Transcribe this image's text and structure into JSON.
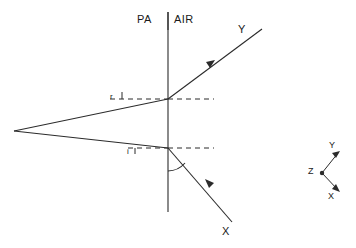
{
  "figure": {
    "type": "optics-refraction-diagram"
  },
  "media": {
    "left_label": "PA",
    "right_label": "AIR"
  },
  "rays": {
    "upper_label": "Y",
    "lower_label": "X"
  },
  "angles": {
    "refraction_label": "r",
    "incidence_label": "i"
  },
  "axes": {
    "origin_label": "Z",
    "up_label": "Y",
    "down_label": "X"
  },
  "colors": {
    "stroke": "#2b2b2b",
    "background": "#ffffff"
  }
}
